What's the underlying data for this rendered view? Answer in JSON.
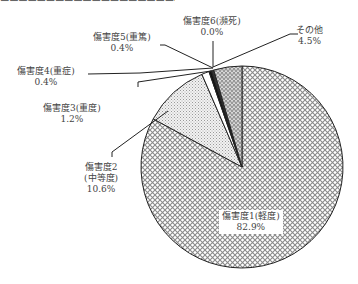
{
  "chart_data": {
    "type": "pie",
    "title": "",
    "title_cut_off": true,
    "start_angle": "12 o'clock",
    "direction": "clockwise",
    "categories": [
      "傷害度1(軽度)",
      "傷害度2(中等度)",
      "傷害度3(重度)",
      "傷害度4(重症)",
      "傷害度5(重篤)",
      "傷害度6(瀕死)",
      "その他"
    ],
    "values": [
      82.9,
      10.6,
      1.2,
      0.4,
      0.4,
      0.0,
      4.5
    ],
    "unit": "%",
    "patterns": [
      "crosshatch",
      "fine-dots",
      "white",
      "black",
      "dark",
      "none",
      "zigzag"
    ],
    "labels": [
      {
        "line1": "傷害度1(軽度)",
        "line2": "82.9%"
      },
      {
        "line1": "傷害度2",
        "line2": "(中等度)",
        "line3": "10.6%"
      },
      {
        "line1": "傷害度3(重度)",
        "line2": "1.2%"
      },
      {
        "line1": "傷害度4(重症)",
        "line2": "0.4%"
      },
      {
        "line1": "傷害度5(重篤)",
        "line2": "0.4%"
      },
      {
        "line1": "傷害度6(瀕死)",
        "line2": "0.0%"
      },
      {
        "line1": "その他",
        "line2": "4.5%"
      }
    ]
  }
}
